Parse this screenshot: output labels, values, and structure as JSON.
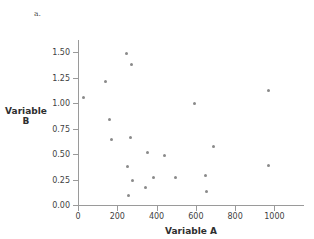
{
  "figure": {
    "top_fragment": "          ",
    "part_label": "a."
  },
  "chart_data": {
    "type": "scatter",
    "title": "",
    "xlabel": "Variable A",
    "ylabel": "Variable B",
    "ylabel_line1": "Variable",
    "ylabel_line2": "B",
    "xlim": [
      0,
      1130
    ],
    "ylim": [
      0.0,
      1.62
    ],
    "grid": false,
    "legend": null,
    "marker": {
      "shape": "circle",
      "color": "#8a8a8a",
      "size_px": 3
    },
    "xticks": [
      0,
      200,
      400,
      600,
      800,
      1000
    ],
    "xtick_labels": [
      "0",
      "200",
      "400",
      "600",
      "800",
      "1000"
    ],
    "yticks": [
      0.0,
      0.25,
      0.5,
      0.75,
      1.0,
      1.25,
      1.5
    ],
    "ytick_labels": [
      "0.00",
      "0.25",
      "0.50",
      "0.75",
      "1.00",
      "1.25",
      "1.50"
    ],
    "points": [
      {
        "x": 27,
        "y": 1.06
      },
      {
        "x": 140,
        "y": 1.21
      },
      {
        "x": 160,
        "y": 0.84
      },
      {
        "x": 168,
        "y": 0.64
      },
      {
        "x": 248,
        "y": 1.49
      },
      {
        "x": 252,
        "y": 0.38
      },
      {
        "x": 255,
        "y": 0.09
      },
      {
        "x": 268,
        "y": 0.66
      },
      {
        "x": 272,
        "y": 1.38
      },
      {
        "x": 278,
        "y": 0.24
      },
      {
        "x": 345,
        "y": 0.17
      },
      {
        "x": 355,
        "y": 0.52
      },
      {
        "x": 385,
        "y": 0.27
      },
      {
        "x": 440,
        "y": 0.49
      },
      {
        "x": 495,
        "y": 0.27
      },
      {
        "x": 595,
        "y": 1.0
      },
      {
        "x": 650,
        "y": 0.29
      },
      {
        "x": 652,
        "y": 0.13
      },
      {
        "x": 690,
        "y": 0.57
      },
      {
        "x": 968,
        "y": 1.12
      },
      {
        "x": 972,
        "y": 0.39
      }
    ]
  }
}
